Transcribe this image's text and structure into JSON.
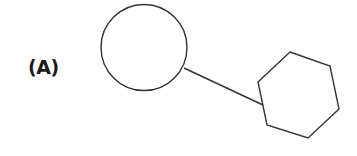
{
  "figure": {
    "label": "(A)",
    "stroke_color": "#333333",
    "stroke_width": 1.4,
    "shapes": {
      "circle": {
        "cx": 144,
        "cy": 47.5,
        "r": 43
      },
      "connector": {
        "x1": 184,
        "y1": 68,
        "x2": 263,
        "y2": 105
      },
      "hexagon": {
        "points": "290,52 330,66 339,109 308,138 267,125 258,82"
      }
    }
  }
}
